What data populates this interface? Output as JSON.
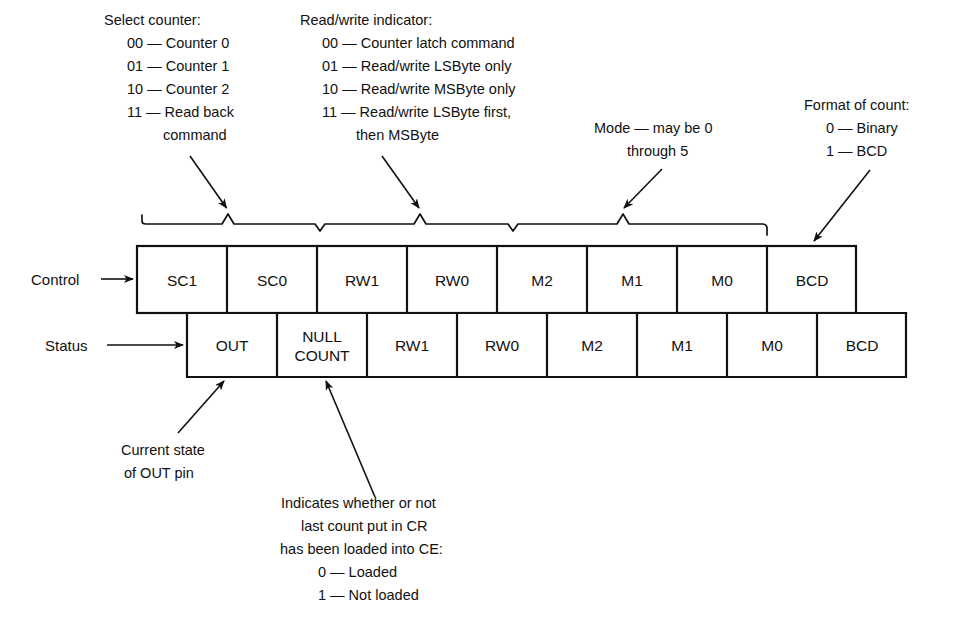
{
  "figure": {
    "ink_color": "#111111",
    "background_color": "#ffffff"
  },
  "annotations": {
    "select_counter": {
      "heading": "Select counter:",
      "lines": [
        "00 — Counter 0",
        "01 — Counter 1",
        "10 — Counter 2",
        "11 — Read back",
        "command"
      ]
    },
    "read_write": {
      "heading": "Read/write indicator:",
      "lines": [
        "00 — Counter latch command",
        "01 — Read/write LSByte only",
        "10 — Read/write MSByte only",
        "11 — Read/write LSByte first,",
        "then MSByte"
      ]
    },
    "mode": {
      "lines": [
        "Mode — may be 0",
        "through 5"
      ]
    },
    "format_of_count": {
      "heading": "Format of count:",
      "lines": [
        "0 — Binary",
        "1 — BCD"
      ]
    },
    "out_pin": {
      "lines": [
        "Current state",
        "of OUT pin"
      ]
    },
    "null_count": {
      "lines": [
        "Indicates whether or not",
        "last count put in CR",
        "has been loaded into CE:",
        "0 — Loaded",
        "1 — Not loaded"
      ]
    }
  },
  "rows": {
    "control": {
      "label": "Control",
      "cells": [
        "SC1",
        "SC0",
        "RW1",
        "RW0",
        "M2",
        "M1",
        "M0",
        "BCD"
      ]
    },
    "status": {
      "label": "Status",
      "cells": [
        "OUT",
        "NULL\nCOUNT",
        "RW1",
        "RW0",
        "M2",
        "M1",
        "M0",
        "BCD"
      ],
      "cell_line1": [
        "OUT",
        "NULL",
        "RW1",
        "RW0",
        "M2",
        "M1",
        "M0",
        "BCD"
      ],
      "cell_line2": [
        "",
        "COUNT",
        "",
        "",
        "",
        "",
        "",
        ""
      ]
    }
  }
}
